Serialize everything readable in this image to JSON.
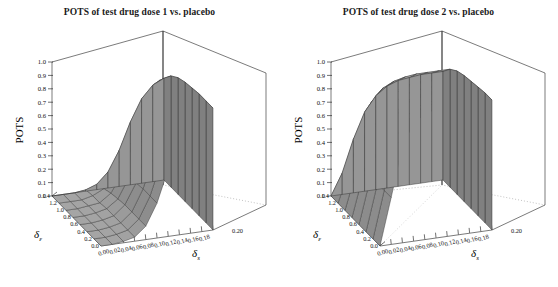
{
  "figure": {
    "background_color": "#ffffff",
    "surface_fill": "#b0b0b0",
    "surface_line": "#303030",
    "axis_color": "#000000"
  },
  "panels": [
    {
      "id": "panel-dose-1",
      "title": "POTS of test drug dose 1 vs. placebo"
    },
    {
      "id": "panel-dose-2",
      "title": "POTS of test drug dose 2 vs. placebo"
    }
  ],
  "axes": {
    "z_label": "POTS",
    "z_ticks": [
      "0.0",
      "0.1",
      "0.2",
      "0.3",
      "0.4",
      "0.5",
      "0.6",
      "0.7",
      "0.8",
      "0.9",
      "1.0"
    ],
    "x_label": "δ",
    "x_label_sub": "s",
    "x_ticks": [
      "0.00",
      "0.02",
      "0.04",
      "0.06",
      "0.08",
      "0.10",
      "0.12",
      "0.14",
      "0.16",
      "0.18",
      "0.20"
    ],
    "y_label": "δ",
    "y_label_sub": "ε",
    "y_ticks": [
      "0.0",
      "0.2",
      "0.4",
      "0.6",
      "0.8",
      "1.0",
      "1.2",
      "1.4"
    ]
  },
  "chart_data": [
    {
      "type": "surface",
      "title": "POTS of test drug dose 1 vs. placebo",
      "xlabel": "δs",
      "ylabel": "δε",
      "zlabel": "POTS",
      "xlim": [
        0.0,
        0.2
      ],
      "ylim": [
        0.0,
        1.4
      ],
      "zlim": [
        0.0,
        1.0
      ],
      "grid": true,
      "legend": "none",
      "x": [
        0.0,
        0.02,
        0.04,
        0.06,
        0.08,
        0.1,
        0.12,
        0.14,
        0.16,
        0.18,
        0.2
      ],
      "y": [
        0.0,
        0.2,
        0.4,
        0.6,
        0.8,
        1.0,
        1.2,
        1.4
      ],
      "z": [
        [
          0.0,
          0.0,
          0.01,
          0.03,
          0.1,
          0.26,
          0.5,
          0.72,
          0.85,
          0.9,
          0.91
        ],
        [
          0.0,
          0.0,
          0.01,
          0.03,
          0.1,
          0.26,
          0.5,
          0.72,
          0.85,
          0.9,
          0.91
        ],
        [
          0.0,
          0.0,
          0.01,
          0.03,
          0.1,
          0.26,
          0.5,
          0.72,
          0.85,
          0.9,
          0.91
        ],
        [
          0.0,
          0.0,
          0.01,
          0.03,
          0.1,
          0.25,
          0.49,
          0.71,
          0.84,
          0.89,
          0.9
        ],
        [
          0.0,
          0.0,
          0.01,
          0.03,
          0.09,
          0.24,
          0.47,
          0.69,
          0.82,
          0.88,
          0.89
        ],
        [
          0.0,
          0.0,
          0.01,
          0.02,
          0.08,
          0.21,
          0.43,
          0.65,
          0.79,
          0.85,
          0.87
        ],
        [
          0.0,
          0.0,
          0.0,
          0.02,
          0.06,
          0.17,
          0.36,
          0.58,
          0.73,
          0.81,
          0.83
        ],
        [
          0.0,
          0.0,
          0.0,
          0.01,
          0.04,
          0.12,
          0.27,
          0.47,
          0.63,
          0.72,
          0.76
        ]
      ]
    },
    {
      "type": "surface",
      "title": "POTS of test drug dose 2 vs. placebo",
      "xlabel": "δs",
      "ylabel": "δε",
      "zlabel": "POTS",
      "xlim": [
        0.0,
        0.2
      ],
      "ylim": [
        0.0,
        1.4
      ],
      "zlim": [
        0.0,
        1.0
      ],
      "grid": true,
      "legend": "none",
      "x": [
        0.0,
        0.02,
        0.04,
        0.06,
        0.08,
        0.1,
        0.12,
        0.14,
        0.16,
        0.18,
        0.2
      ],
      "y": [
        0.0,
        0.2,
        0.4,
        0.6,
        0.8,
        1.0,
        1.2,
        1.4
      ],
      "z": [
        [
          0.0,
          0.35,
          0.72,
          0.88,
          0.94,
          0.96,
          0.97,
          0.97,
          0.97,
          0.97,
          0.97
        ],
        [
          0.0,
          0.35,
          0.72,
          0.88,
          0.94,
          0.96,
          0.97,
          0.97,
          0.97,
          0.97,
          0.97
        ],
        [
          0.0,
          0.34,
          0.71,
          0.87,
          0.93,
          0.95,
          0.96,
          0.96,
          0.96,
          0.96,
          0.96
        ],
        [
          0.0,
          0.33,
          0.69,
          0.86,
          0.92,
          0.94,
          0.95,
          0.95,
          0.95,
          0.95,
          0.95
        ],
        [
          0.0,
          0.31,
          0.66,
          0.83,
          0.9,
          0.93,
          0.94,
          0.94,
          0.94,
          0.94,
          0.94
        ],
        [
          0.0,
          0.28,
          0.61,
          0.79,
          0.87,
          0.9,
          0.91,
          0.92,
          0.92,
          0.92,
          0.92
        ],
        [
          0.0,
          0.23,
          0.53,
          0.72,
          0.81,
          0.85,
          0.87,
          0.88,
          0.88,
          0.88,
          0.88
        ],
        [
          0.0,
          0.16,
          0.4,
          0.59,
          0.7,
          0.76,
          0.79,
          0.8,
          0.81,
          0.81,
          0.81
        ]
      ]
    }
  ]
}
